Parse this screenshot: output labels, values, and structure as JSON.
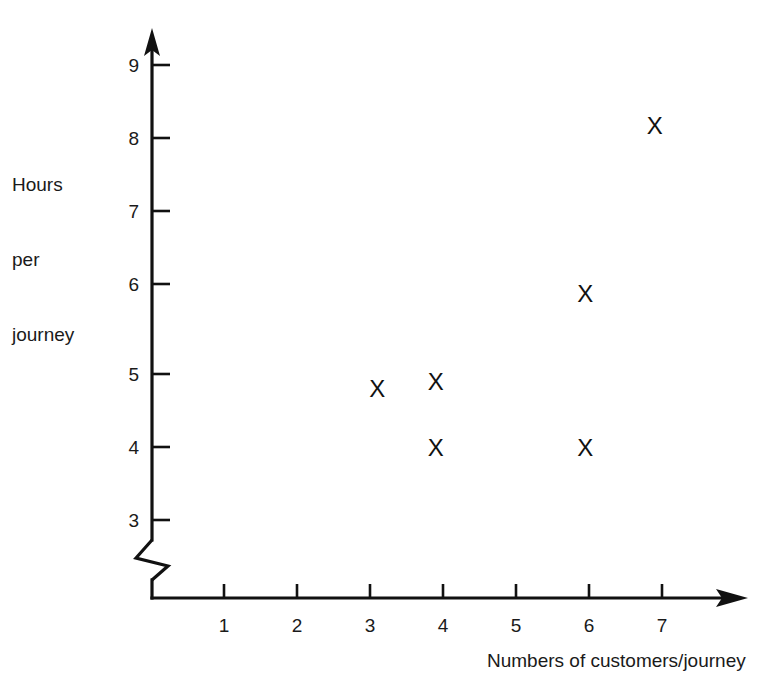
{
  "chart_data": {
    "type": "scatter",
    "title": "",
    "xlabel": "Numbers of customers/journey",
    "ylabel": "Hours per journey",
    "ylabel_lines": [
      "Hours",
      "per",
      "journey"
    ],
    "x": [
      3.1,
      3.9,
      3.9,
      5.95,
      5.95,
      6.9
    ],
    "y": [
      4.8,
      4.9,
      4.0,
      6.1,
      4.0,
      8.4
    ],
    "points": [
      {
        "x": 3.1,
        "y": 4.8,
        "marker": "X"
      },
      {
        "x": 3.9,
        "y": 4.9,
        "marker": "X"
      },
      {
        "x": 3.9,
        "y": 4.0,
        "marker": "X"
      },
      {
        "x": 5.95,
        "y": 6.1,
        "marker": "X"
      },
      {
        "x": 5.95,
        "y": 4.0,
        "marker": "X"
      },
      {
        "x": 6.9,
        "y": 8.4,
        "marker": "X"
      }
    ],
    "marker_symbol": "X",
    "xlim": [
      0,
      8
    ],
    "ylim": [
      3,
      9
    ],
    "y_axis_break": true,
    "y_axis_break_note": "zigzag break on vertical axis below 3",
    "xticks": [
      1,
      2,
      3,
      4,
      5,
      6,
      7
    ],
    "yticks": [
      3,
      4,
      5,
      6,
      7,
      8,
      9
    ],
    "xtick_labels": [
      "1",
      "2",
      "3",
      "4",
      "5",
      "6",
      "7"
    ],
    "ytick_labels": [
      "3",
      "4",
      "5",
      "6",
      "7",
      "8",
      "9"
    ],
    "grid": false,
    "legend": null,
    "legend_position": "none",
    "axis_arrows": true,
    "colors": {
      "axis": "#111111",
      "marker": "#111111",
      "background": "#ffffff",
      "text": "#1a1a1a"
    }
  }
}
